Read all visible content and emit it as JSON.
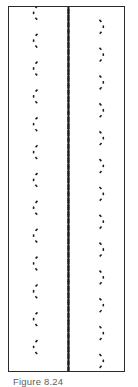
{
  "figure": {
    "caption": "Figure 8.24",
    "frame": {
      "border_color": "#2b2b2b",
      "background_color": "#ffffff",
      "x": 8,
      "y": 6,
      "width": 117,
      "height": 366
    },
    "caption_color": "#5e5e5e"
  },
  "chart_data": {
    "type": "diagram",
    "title": "Figure 8.24",
    "subtitle": "",
    "xlabel": "",
    "ylabel": "",
    "stroke_color": "#1c1c1c",
    "stroke_width": 1.6,
    "dash_pattern": [
      2.6,
      4.2
    ],
    "band": {
      "left": 20,
      "right": 101,
      "top": 0,
      "bottom": 366,
      "center_x": 60.5,
      "width": 81
    },
    "strands": {
      "count_per_direction": 5,
      "directions": [
        "down-right",
        "down-left"
      ],
      "vertical_period": 56,
      "amplitude": 30.5,
      "phase_offsets": [
        0,
        11.2,
        22.4,
        33.6,
        44.8
      ],
      "crossings_visible": 26
    },
    "edge_loops": {
      "left_x": 22,
      "right_x": 99,
      "spacing": 28,
      "count": 13
    },
    "legend": [],
    "annotations": [],
    "grid": false
  }
}
